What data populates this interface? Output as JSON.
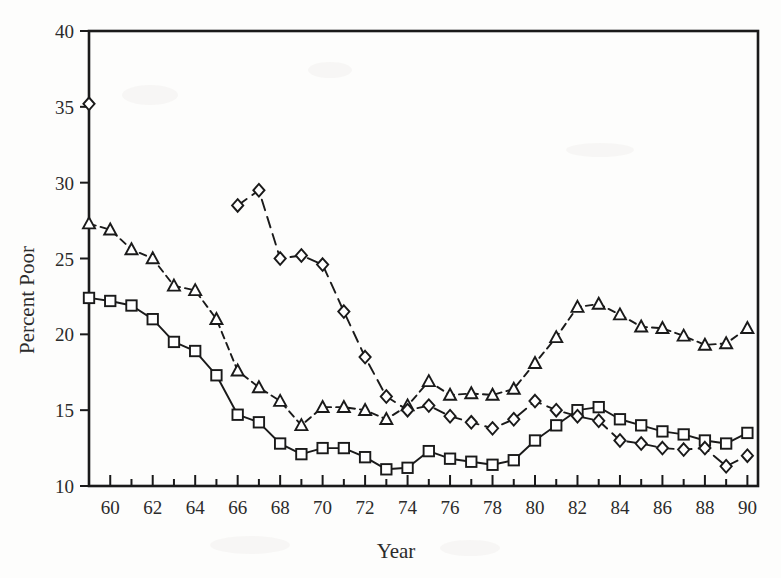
{
  "chart_data": {
    "type": "line",
    "title": "",
    "xlabel": "Year",
    "ylabel": "Percent Poor",
    "xlim": [
      59,
      90.5
    ],
    "ylim": [
      10,
      40
    ],
    "grid": false,
    "legend": "none",
    "x_ticks": [
      60,
      62,
      64,
      66,
      68,
      70,
      72,
      74,
      76,
      78,
      80,
      82,
      84,
      86,
      88,
      90
    ],
    "x_tick_labels": [
      "60",
      "62",
      "64",
      "66",
      "68",
      "70",
      "72",
      "74",
      "76",
      "78",
      "80",
      "82",
      "84",
      "86",
      "88",
      "90"
    ],
    "x_minor_ticks": [
      59,
      61,
      63,
      65,
      67,
      69,
      71,
      73,
      75,
      77,
      79,
      81,
      83,
      85,
      87,
      89
    ],
    "y_ticks": [
      10,
      15,
      20,
      25,
      30,
      35,
      40
    ],
    "y_tick_labels": [
      "10",
      "15",
      "20",
      "25",
      "30",
      "35",
      "40"
    ],
    "series": [
      {
        "name": "squares-series",
        "marker": "square",
        "linestyle": "solid",
        "x": [
          59,
          60,
          61,
          62,
          63,
          64,
          65,
          66,
          67,
          68,
          69,
          70,
          71,
          72,
          73,
          74,
          75,
          76,
          77,
          78,
          79,
          80,
          81,
          82,
          83,
          84,
          85,
          86,
          87,
          88,
          89,
          90
        ],
        "values": [
          22.4,
          22.2,
          21.9,
          21.0,
          19.5,
          18.9,
          17.3,
          14.7,
          14.2,
          12.8,
          12.1,
          12.5,
          12.5,
          11.9,
          11.1,
          11.2,
          12.3,
          11.8,
          11.6,
          11.4,
          11.7,
          13.0,
          14.0,
          15.0,
          15.2,
          14.4,
          14.0,
          13.6,
          13.4,
          13.0,
          12.8,
          13.5
        ]
      },
      {
        "name": "triangles-series",
        "marker": "triangle",
        "linestyle": "dashed",
        "x": [
          59,
          60,
          61,
          62,
          63,
          64,
          65,
          66,
          67,
          68,
          69,
          70,
          71,
          72,
          73,
          74,
          75,
          76,
          77,
          78,
          79,
          80,
          81,
          82,
          83,
          84,
          85,
          86,
          87,
          88,
          89,
          90
        ],
        "values": [
          27.3,
          26.9,
          25.6,
          25.0,
          23.2,
          22.9,
          21.0,
          17.6,
          16.5,
          15.6,
          14.0,
          15.2,
          15.2,
          15.0,
          14.4,
          15.3,
          16.9,
          16.0,
          16.1,
          16.0,
          16.4,
          18.1,
          19.8,
          21.8,
          22.0,
          21.3,
          20.5,
          20.4,
          19.9,
          19.3,
          19.4,
          20.4
        ]
      },
      {
        "name": "diamonds-series",
        "marker": "diamond",
        "linestyle": "longdash",
        "x": [
          66,
          67,
          68,
          69,
          70,
          71,
          72,
          73,
          74,
          75,
          76,
          77,
          78,
          79,
          80,
          81,
          82,
          83,
          84,
          85,
          86,
          87,
          88,
          89,
          90
        ],
        "values": [
          28.5,
          29.5,
          25.0,
          25.2,
          24.6,
          21.5,
          18.5,
          15.9,
          15.0,
          15.3,
          14.6,
          14.2,
          13.8,
          14.4,
          15.6,
          15.0,
          14.6,
          14.3,
          13.0,
          12.8,
          12.5,
          12.4,
          12.5,
          11.3,
          12.0
        ]
      },
      {
        "name": "isolated-diamond-point",
        "marker": "diamond",
        "linestyle": "none",
        "x": [
          59
        ],
        "values": [
          35.2
        ]
      }
    ]
  },
  "colors": {
    "ink": "#1a1a1a",
    "background": "#fdfdfc",
    "marker_fill": "#ffffff"
  }
}
